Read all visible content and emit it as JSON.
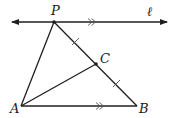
{
  "diagram": {
    "type": "geometry",
    "labels": {
      "P": "P",
      "C": "C",
      "A": "A",
      "B": "B",
      "line": "ℓ"
    },
    "points": {
      "P": [
        54,
        22
      ],
      "C": [
        96,
        64
      ],
      "A": [
        21,
        106
      ],
      "B": [
        137,
        106
      ]
    },
    "line_l": {
      "from": [
        12,
        22
      ],
      "to": [
        167,
        22
      ],
      "arrows": "both"
    },
    "segments": [
      "PA",
      "PB",
      "AB",
      "AC"
    ],
    "markings": {
      "parallel": [
        "line ℓ",
        "AB"
      ],
      "congruent": [
        "PC",
        "CB"
      ]
    },
    "colors": {
      "stroke": "#1f1f1f",
      "background": "#ffffff"
    }
  }
}
